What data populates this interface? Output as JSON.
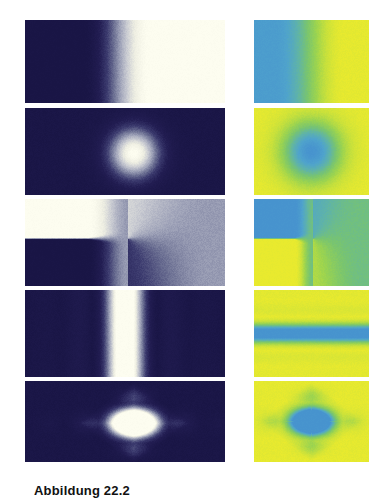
{
  "figure": {
    "caption": "Abbildung 22.2",
    "caption_visible_fragment": "Abbildung 22.2",
    "background_color": "#ffffff",
    "width": 383,
    "height": 494,
    "columns": [
      {
        "id": "left-column",
        "label": "grayscale-bone-column",
        "x": 25,
        "width": 200
      },
      {
        "id": "right-column",
        "label": "blue-green-yellow-column",
        "x": 254,
        "width": 115
      }
    ],
    "colormaps": {
      "bone": {
        "name": "bone-navy-cream",
        "stops": [
          "#191545",
          "#221d52",
          "#3b3a6e",
          "#6b6f92",
          "#9ea2b8",
          "#c9cbd2",
          "#eeeee2",
          "#fdfdf0"
        ]
      },
      "bgy": {
        "name": "blue-green-yellow",
        "stops": [
          "#4793ce",
          "#4fa3cc",
          "#5fb3a8",
          "#78c470",
          "#9ad350",
          "#c6e03c",
          "#e9ea2e"
        ]
      }
    }
  },
  "chart_data": [
    {
      "id": "panel-1-left",
      "type": "heatmap",
      "title": "",
      "row": 1,
      "column": "left",
      "colormap": "bone",
      "field": "step-edge-x",
      "description": "Horizontal gradient: dark navy at left, smooth sigmoid ramp to cream white at right",
      "params": {
        "edge_x": 0.46,
        "softness": 0.17,
        "low": 0.0,
        "high": 1.0
      },
      "xlabel": "",
      "ylabel": "",
      "zlim": [
        0,
        1
      ],
      "grid": false
    },
    {
      "id": "panel-1-right",
      "type": "heatmap",
      "title": "",
      "row": 1,
      "column": "right",
      "colormap": "bgy",
      "field": "step-edge-x",
      "description": "Horizontal gradient: blue at left, green mid, yellow at right",
      "params": {
        "edge_x": 0.48,
        "softness": 0.3,
        "low": 0.1,
        "high": 0.98
      },
      "xlabel": "",
      "ylabel": "",
      "zlim": [
        0,
        1
      ],
      "grid": false
    },
    {
      "id": "panel-2-left",
      "type": "heatmap",
      "title": "",
      "row": 2,
      "column": "left",
      "colormap": "bone",
      "field": "radial-gaussian",
      "description": "Radial Gaussian blob, bright centre slightly right of middle on dark navy field",
      "params": {
        "cx": 0.545,
        "cy": 0.52,
        "sigma": 0.195,
        "aspect": 2.3,
        "low": 0.02,
        "high": 1.0
      },
      "xlabel": "",
      "ylabel": "",
      "zlim": [
        0,
        1
      ],
      "grid": false
    },
    {
      "id": "panel-2-right",
      "type": "heatmap",
      "title": "",
      "row": 2,
      "column": "right",
      "colormap": "bgy",
      "field": "radial-gaussian-inverted",
      "description": "Radial blob rendered inverted: blue core, green ring, yellow surround",
      "params": {
        "cx": 0.5,
        "cy": 0.5,
        "sigma": 0.24,
        "aspect": 1.35,
        "low": 0.02,
        "high": 1.0
      },
      "xlabel": "",
      "ylabel": "",
      "zlim": [
        0,
        1
      ],
      "grid": false
    },
    {
      "id": "panel-3-left",
      "type": "heatmap",
      "title": "",
      "row": 3,
      "column": "left",
      "colormap": "bone",
      "field": "branch-cut-phase",
      "description": "Phase-like discontinuity: cream upper-left block, navy lower-left block, sharp horizontal cut meeting a point, blending to mid grey-blue on the right",
      "params": {
        "cut_x": 0.515,
        "cut_y": 0.455,
        "softness": 0.2,
        "right_level": 0.55
      },
      "xlabel": "",
      "ylabel": "",
      "zlim": [
        0,
        1
      ],
      "grid": false
    },
    {
      "id": "panel-3-right",
      "type": "heatmap",
      "title": "",
      "row": 3,
      "column": "right",
      "colormap": "bgy",
      "field": "branch-cut-phase-inverted",
      "description": "Same discontinuity in blue/green/yellow: blue upper-left, yellow-green lower-left, green right half",
      "params": {
        "cut_x": 0.515,
        "cut_y": 0.455,
        "softness": 0.16,
        "right_level": 0.55
      },
      "xlabel": "",
      "ylabel": "",
      "zlim": [
        0,
        1
      ],
      "grid": false
    },
    {
      "id": "panel-4-left",
      "type": "heatmap",
      "title": "",
      "row": 4,
      "column": "left",
      "colormap": "bone",
      "field": "sinc-vertical-bands",
      "description": "Vertical diffraction bands: bright central stripe with symmetric secondary lobes decaying to navy",
      "params": {
        "cx": 0.5,
        "frequency": 3.05,
        "decay": 2.05,
        "low": 0.02,
        "high": 1.0
      },
      "xlabel": "",
      "ylabel": "",
      "zlim": [
        0,
        1
      ],
      "grid": false
    },
    {
      "id": "panel-4-right",
      "type": "heatmap",
      "title": "",
      "row": 4,
      "column": "right",
      "colormap": "bgy",
      "field": "sinc-horizontal-bands",
      "description": "Horizontal bands: yellow central stripe, green lobes, blue outer field",
      "params": {
        "cy": 0.5,
        "frequency": 2.55,
        "decay": 2.2,
        "low": 0.02,
        "high": 1.0
      },
      "xlabel": "",
      "ylabel": "",
      "zlim": [
        0,
        1
      ],
      "grid": false
    },
    {
      "id": "panel-5-left",
      "type": "heatmap",
      "title": "",
      "row": 5,
      "column": "left",
      "colormap": "bone",
      "field": "separable-sinc-star",
      "description": "Diamond / star shaped bright separable sinc product centred slightly right of middle on navy",
      "params": {
        "cx": 0.545,
        "cy": 0.52,
        "fx": 2.0,
        "fy": 2.0,
        "aspect": 2.3,
        "low": 0.02,
        "high": 1.0
      },
      "xlabel": "",
      "ylabel": "",
      "zlim": [
        0,
        1
      ],
      "grid": false
    },
    {
      "id": "panel-5-right",
      "type": "heatmap",
      "title": "",
      "row": 5,
      "column": "right",
      "colormap": "bgy",
      "field": "separable-sinc-star-inverted",
      "description": "Diamond shape in blue/green/yellow: yellow core, green diamond, blue surround",
      "params": {
        "cx": 0.5,
        "cy": 0.5,
        "fx": 2.1,
        "fy": 2.1,
        "aspect": 1.4,
        "low": 0.02,
        "high": 1.0
      },
      "xlabel": "",
      "ylabel": "",
      "zlim": [
        0,
        1
      ],
      "grid": false
    }
  ],
  "layout": {
    "rows": [
      {
        "index": 1,
        "top": 20,
        "height": 83
      },
      {
        "index": 2,
        "top": 108,
        "height": 87
      },
      {
        "index": 3,
        "top": 199,
        "height": 87
      },
      {
        "index": 4,
        "top": 290,
        "height": 87
      },
      {
        "index": 5,
        "top": 381,
        "height": 81
      }
    ]
  }
}
